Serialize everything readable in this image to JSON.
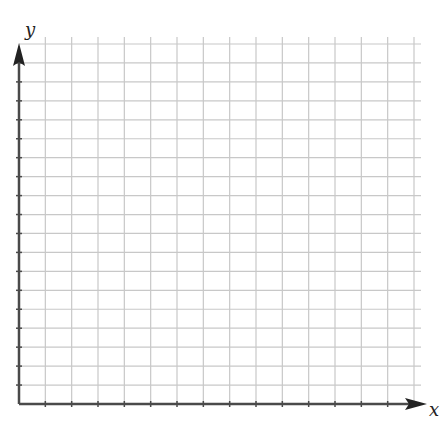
{
  "diagram": {
    "type": "blank-coordinate-grid",
    "x_axis_label": "x",
    "y_axis_label": "y",
    "columns": 15,
    "rows": 19,
    "colors": {
      "background": "#ffffff",
      "grid": "#c8c8c8",
      "axis": "#4a4a4a",
      "arrow": "#222222",
      "label": "#222222"
    }
  }
}
